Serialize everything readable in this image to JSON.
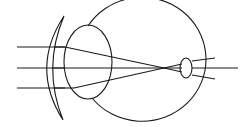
{
  "diagram": {
    "title": "",
    "colors": {
      "stroke": "#1a1a1a",
      "background": "#ffffff"
    },
    "elements": [
      "incoming-rays",
      "corrective-meniscus-lens",
      "crystalline-lens",
      "eyeball",
      "focal-point",
      "optic-nerve-bulb",
      "diverging-rays"
    ]
  }
}
